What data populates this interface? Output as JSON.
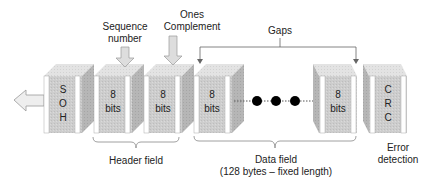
{
  "labels": {
    "sequence_number_line1": "Sequence",
    "sequence_number_line2": "number",
    "ones_complement_line1": "Ones",
    "ones_complement_line2": "Complement",
    "gaps": "Gaps",
    "header_field": "Header field",
    "data_field_line1": "Data field",
    "data_field_line2": "(128 bytes – fixed length)",
    "error_detection_line1": "Error",
    "error_detection_line2": "detection"
  },
  "blocks": {
    "soh": [
      "S",
      "O",
      "H"
    ],
    "seq": [
      "8",
      "bits"
    ],
    "ones": [
      "8",
      "bits"
    ],
    "data_first": [
      "8",
      "bits"
    ],
    "data_last": [
      "8",
      "bits"
    ],
    "crc": [
      "C",
      "R",
      "C"
    ]
  },
  "colors": {
    "front": "#cfcfcf",
    "top": "#e2e2e2",
    "side": "#b4b4b4",
    "stripe": "#ffffff",
    "dot": "#000000",
    "line": "#666666"
  }
}
